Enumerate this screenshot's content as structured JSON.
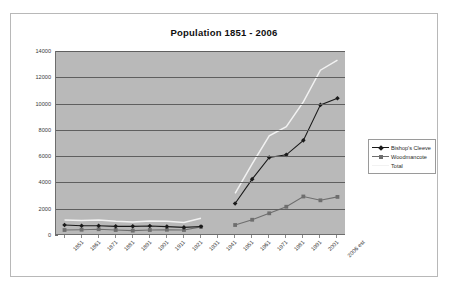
{
  "chart": {
    "title": "Population 1851 - 2006",
    "background": "#ffffff",
    "plot_background": "#b9b9b9",
    "border_color": "#b8b8b8"
  },
  "legend": {
    "position": "right",
    "entries": [
      {
        "label": "Bishop's Cleeve",
        "color": "#1a1a1a",
        "marker": "diamond"
      },
      {
        "label": "Woodmancote",
        "color": "#6e6e6e",
        "marker": "square"
      },
      {
        "label": "Total",
        "color": "#f2f2f2",
        "marker": "none"
      }
    ]
  },
  "chart_data": {
    "type": "line",
    "title": "Population 1851 - 2006",
    "xlabel": "",
    "ylabel": "",
    "ylim": [
      0,
      14000
    ],
    "ytick_step": 2000,
    "yticks": [
      0,
      2000,
      4000,
      6000,
      8000,
      10000,
      12000,
      14000
    ],
    "grid": true,
    "categories": [
      "1851",
      "1861",
      "1871",
      "1881",
      "1891",
      "1901",
      "1911",
      "1921",
      "1931",
      "1941",
      "1951",
      "1961",
      "1971",
      "1981",
      "1991",
      "2001",
      "2006 est"
    ],
    "series": [
      {
        "name": "Bishop's Cleeve",
        "color": "#1a1a1a",
        "marker": "diamond",
        "values": [
          760,
          700,
          700,
          660,
          660,
          690,
          640,
          580,
          650,
          null,
          2400,
          4250,
          5900,
          6100,
          7200,
          9900,
          10400
        ]
      },
      {
        "name": "Woodmancote",
        "color": "#6e6e6e",
        "marker": "square",
        "values": [
          380,
          400,
          440,
          380,
          330,
          380,
          400,
          380,
          620,
          null,
          760,
          1160,
          1650,
          2150,
          2930,
          2640,
          2900
        ]
      },
      {
        "name": "Total",
        "color": "#f2f2f2",
        "marker": "none",
        "values": [
          1140,
          1100,
          1140,
          1040,
          990,
          1070,
          1040,
          960,
          1270,
          null,
          3160,
          5410,
          7550,
          8250,
          10130,
          12540,
          13300
        ]
      }
    ]
  }
}
